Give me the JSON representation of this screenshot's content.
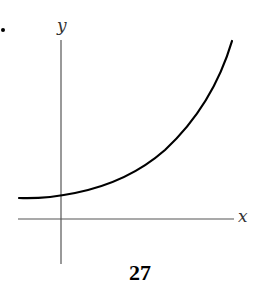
{
  "figure": {
    "type": "function-graph",
    "axes": {
      "x_label": "x",
      "y_label": "y"
    },
    "curve": {
      "shape": "exponential-growth",
      "color": "#000000"
    },
    "axis_color": "#555555"
  },
  "page": {
    "number": "27"
  }
}
